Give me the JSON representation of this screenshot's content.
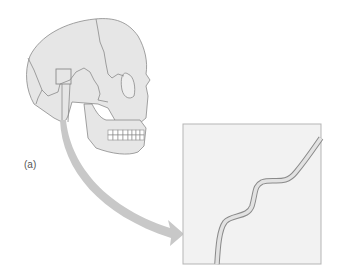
{
  "figure": {
    "panel_label": "(a)",
    "parts": {
      "skull": "lateral view of human skull with sutures",
      "highlight_box": "small square marking suture region",
      "arrow": "curved gray arrow from skull to inset",
      "inset": "magnified view of wavy suture line"
    },
    "colors": {
      "bone_fill": "#e6e6e6",
      "bone_outline": "#8a8a8a",
      "arrow_fill": "#c8c8c8",
      "inset_fill": "#f2f2f2",
      "inset_border": "#b5b5b5",
      "suture_fill": "#e2e2e2",
      "label": "#555555"
    }
  }
}
